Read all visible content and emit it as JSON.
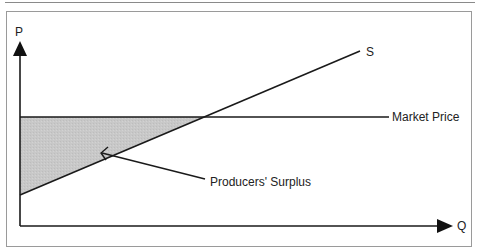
{
  "diagram": {
    "title": "Producers' Surplus",
    "axes": {
      "y_label": "P",
      "x_label": "Q"
    },
    "curves": {
      "supply_label": "S",
      "price_label": "Market Price"
    },
    "annotations": {
      "surplus_label": "Producers' Surplus"
    },
    "colors": {
      "line": "#1a1a1a",
      "surplus_fill": "#c9c9c9",
      "frame": "#9a9a9a"
    }
  }
}
